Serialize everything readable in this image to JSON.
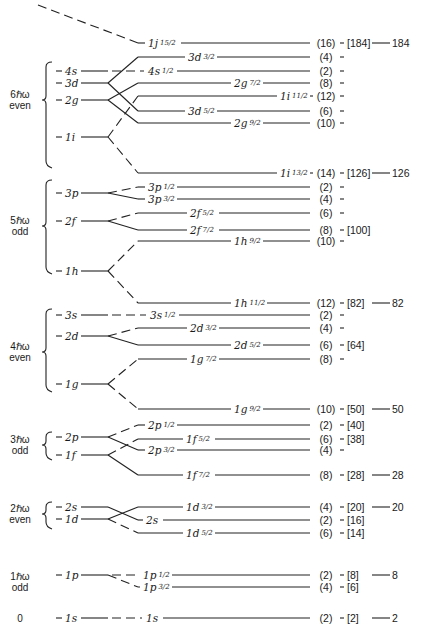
{
  "oscillator_shells": [
    {
      "energy": "6ℏω",
      "parity": "even",
      "y_label": 100,
      "bracket": [
        62,
        166
      ],
      "levels": [
        {
          "name": "4s",
          "y": 71
        },
        {
          "name": "3d",
          "y": 83
        },
        {
          "name": "2g",
          "y": 100
        },
        {
          "name": "1i",
          "y": 137
        }
      ]
    },
    {
      "energy": "5ℏω",
      "parity": "odd",
      "y_label": 226,
      "bracket": [
        180,
        272
      ],
      "levels": [
        {
          "name": "3p",
          "y": 193
        },
        {
          "name": "2f",
          "y": 221
        },
        {
          "name": "1h",
          "y": 271
        }
      ]
    },
    {
      "energy": "4ℏω",
      "parity": "even",
      "y_label": 352,
      "bracket": [
        309,
        390
      ],
      "levels": [
        {
          "name": "3s",
          "y": 315
        },
        {
          "name": "2d",
          "y": 336
        },
        {
          "name": "1g",
          "y": 384
        }
      ]
    },
    {
      "energy": "3ℏω",
      "parity": "odd",
      "y_label": 445,
      "bracket": [
        432,
        458
      ],
      "levels": [
        {
          "name": "2p",
          "y": 437
        },
        {
          "name": "1f",
          "y": 455
        }
      ]
    },
    {
      "energy": "2ℏω",
      "parity": "even",
      "y_label": 514,
      "bracket": [
        502,
        527
      ],
      "levels": [
        {
          "name": "2s",
          "y": 507
        },
        {
          "name": "1d",
          "y": 519
        }
      ]
    },
    {
      "energy": "1ℏω",
      "parity": "odd",
      "y_label": 582,
      "bracket": null,
      "levels": [
        {
          "name": "1p",
          "y": 575
        }
      ]
    },
    {
      "energy": "0",
      "parity": "",
      "y_label": 618,
      "bracket": null,
      "levels": [
        {
          "name": "1s",
          "y": 618
        }
      ]
    }
  ],
  "split_levels": [
    {
      "name": "1j",
      "j": "15/2",
      "y": 43,
      "from_y": 0,
      "from_x": 38,
      "dashed": true,
      "label_x": 148,
      "deg": "(16)",
      "magic": "[184]",
      "final": "184"
    },
    {
      "name": "3d",
      "j": "3/2",
      "y": 57,
      "from_y": 83,
      "dashed": false,
      "label_x": 188,
      "deg": "(4)",
      "magic": "",
      "final": ""
    },
    {
      "name": "4s",
      "j": "1/2",
      "y": 71,
      "from_y": 71,
      "dashed": true,
      "label_x": 148,
      "deg": "(2)",
      "magic": "",
      "final": ""
    },
    {
      "name": "2g",
      "j": "7/2",
      "y": 83,
      "from_y": 100,
      "dashed": false,
      "label_x": 234,
      "deg": "(8)",
      "magic": "",
      "final": ""
    },
    {
      "name": "1i",
      "j": "11/2",
      "y": 96,
      "from_y": 137,
      "dashed": true,
      "label_x": 280,
      "deg": "(12)",
      "magic": "",
      "final": ""
    },
    {
      "name": "3d",
      "j": "5/2",
      "y": 111,
      "from_y": 83,
      "dashed": false,
      "label_x": 188,
      "deg": "(6)",
      "magic": "",
      "final": ""
    },
    {
      "name": "2g",
      "j": "9/2",
      "y": 123,
      "from_y": 100,
      "dashed": false,
      "label_x": 234,
      "deg": "(10)",
      "magic": "",
      "final": ""
    },
    {
      "name": "1i",
      "j": "13/2",
      "y": 173,
      "from_y": 137,
      "dashed": true,
      "label_x": 280,
      "deg": "(14)",
      "magic": "[126]",
      "final": "126"
    },
    {
      "name": "3p",
      "j": "1/2",
      "y": 187,
      "from_y": 193,
      "dashed": true,
      "label_x": 148,
      "deg": "(2)",
      "magic": "",
      "final": ""
    },
    {
      "name": "3p",
      "j": "3/2",
      "y": 199,
      "from_y": 193,
      "dashed": false,
      "label_x": 148,
      "deg": "(4)",
      "magic": "",
      "final": ""
    },
    {
      "name": "2f",
      "j": "5/2",
      "y": 213,
      "from_y": 221,
      "dashed": true,
      "label_x": 190,
      "deg": "(6)",
      "magic": "",
      "final": ""
    },
    {
      "name": "2f",
      "j": "7/2",
      "y": 230,
      "from_y": 221,
      "dashed": false,
      "label_x": 190,
      "deg": "(8)",
      "magic": "[100]",
      "final": ""
    },
    {
      "name": "1h",
      "j": "9/2",
      "y": 241,
      "from_y": 271,
      "dashed": true,
      "label_x": 234,
      "deg": "(10)",
      "magic": "",
      "final": ""
    },
    {
      "name": "1h",
      "j": "11/2",
      "y": 303,
      "from_y": 271,
      "dashed": true,
      "label_x": 234,
      "deg": "(12)",
      "magic": "[82]",
      "final": "82"
    },
    {
      "name": "3s",
      "j": "1/2",
      "y": 315,
      "from_y": 315,
      "dashed": true,
      "label_x": 150,
      "deg": "(2)",
      "magic": "",
      "final": ""
    },
    {
      "name": "2d",
      "j": "3/2",
      "y": 328,
      "from_y": 336,
      "dashed": true,
      "label_x": 190,
      "deg": "(4)",
      "magic": "",
      "final": ""
    },
    {
      "name": "2d",
      "j": "5/2",
      "y": 345,
      "from_y": 336,
      "dashed": false,
      "label_x": 234,
      "deg": "(6)",
      "magic": "[64]",
      "final": ""
    },
    {
      "name": "1g",
      "j": "7/2",
      "y": 359,
      "from_y": 384,
      "dashed": true,
      "label_x": 190,
      "deg": "(8)",
      "magic": "",
      "final": ""
    },
    {
      "name": "1g",
      "j": "9/2",
      "y": 409,
      "from_y": 384,
      "dashed": true,
      "label_x": 234,
      "deg": "(10)",
      "magic": "[50]",
      "final": "50"
    },
    {
      "name": "2p",
      "j": "1/2",
      "y": 425,
      "from_y": 437,
      "dashed": true,
      "label_x": 148,
      "deg": "(2)",
      "magic": "[40]",
      "final": ""
    },
    {
      "name": "1f",
      "j": "5/2",
      "y": 439,
      "from_y": 455,
      "dashed": true,
      "label_x": 186,
      "deg": "(6)",
      "magic": "[38]",
      "final": ""
    },
    {
      "name": "2p",
      "j": "3/2",
      "y": 450,
      "from_y": 437,
      "dashed": false,
      "label_x": 148,
      "deg": "(4)",
      "magic": "",
      "final": ""
    },
    {
      "name": "1f",
      "j": "7/2",
      "y": 475,
      "from_y": 455,
      "dashed": false,
      "label_x": 186,
      "deg": "(8)",
      "magic": "[28]",
      "final": "28"
    },
    {
      "name": "1d",
      "j": "3/2",
      "y": 507,
      "from_y": 519,
      "dashed": false,
      "label_x": 186,
      "deg": "(4)",
      "magic": "[20]",
      "final": "20"
    },
    {
      "name": "2s",
      "j": "",
      "y": 520,
      "from_y": 507,
      "dashed": false,
      "label_x": 146,
      "deg": "(2)",
      "magic": "[16]",
      "final": ""
    },
    {
      "name": "1d",
      "j": "5/2",
      "y": 533,
      "from_y": 519,
      "dashed": true,
      "label_x": 186,
      "deg": "(6)",
      "magic": "[14]",
      "final": ""
    },
    {
      "name": "1p",
      "j": "1/2",
      "y": 575,
      "from_y": 575,
      "dashed": true,
      "label_x": 143,
      "deg": "(2)",
      "magic": "[8]",
      "final": "8"
    },
    {
      "name": "1p",
      "j": "3/2",
      "y": 587,
      "from_y": 575,
      "dashed": true,
      "label_x": 143,
      "deg": "(4)",
      "magic": "[6]",
      "final": ""
    },
    {
      "name": "1s",
      "j": "",
      "y": 618,
      "from_y": 618,
      "dashed": true,
      "label_x": 146,
      "deg": "(2)",
      "magic": "[2]",
      "final": "2"
    }
  ],
  "magic_numbers": [
    "2",
    "8",
    "20",
    "28",
    "50",
    "82",
    "126",
    "184"
  ],
  "subshell_closures": [
    "[2]",
    "[6]",
    "[8]",
    "[14]",
    "[16]",
    "[20]",
    "[28]",
    "[38]",
    "[40]",
    "[50]",
    "[64]",
    "[82]",
    "[100]",
    "[126]",
    "[184]"
  ]
}
